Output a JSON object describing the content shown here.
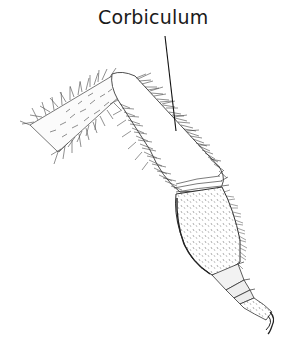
{
  "figure": {
    "background_color": "#ffffff",
    "ink_color": "#2a2a2a"
  },
  "labels": [
    {
      "text": "Corbiculum",
      "target": "tibia",
      "leader_line": {
        "x1": 165,
        "y1": 36,
        "x2": 176,
        "y2": 131
      }
    }
  ],
  "parts": [
    {
      "name": "femur",
      "description": "hairy segment extending to upper-left"
    },
    {
      "name": "tibia",
      "description": "smooth concave surface fringed with long hairs (corbiculum / pollen basket)"
    },
    {
      "name": "basitarsus",
      "description": "broad stippled segment below tibia"
    },
    {
      "name": "tarsal-segments",
      "description": "small segments ending in claw"
    }
  ]
}
